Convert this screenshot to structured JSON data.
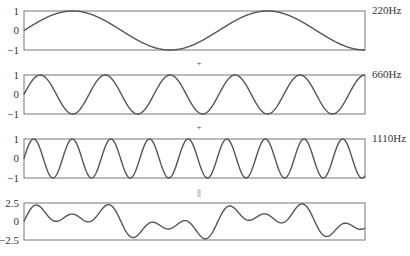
{
  "chart_data": {
    "type": "line",
    "xlabel": "",
    "ylabel": "",
    "grid": false,
    "duration_cycles_of_base": 1.75,
    "series": [
      {
        "name": "220Hz",
        "frequency": 220,
        "amplitude": 1,
        "ylim": [
          -1,
          1
        ],
        "yticks": [
          "1",
          "0",
          "−1"
        ]
      },
      {
        "name": "660Hz",
        "frequency": 660,
        "amplitude": 1,
        "ylim": [
          -1,
          1
        ],
        "yticks": [
          "1",
          "0",
          "−1"
        ]
      },
      {
        "name": "1110Hz",
        "frequency": 1110,
        "amplitude": 1,
        "ylim": [
          -1,
          1
        ],
        "yticks": [
          "1",
          "0",
          "−1"
        ]
      },
      {
        "name": "sum",
        "frequency": null,
        "amplitude": null,
        "ylim": [
          -2.5,
          2.5
        ],
        "yticks": [
          "2.5",
          "0",
          "−2.5"
        ]
      }
    ],
    "operators": [
      "+",
      "+",
      "="
    ]
  },
  "labels": {
    "panel1": "220Hz",
    "panel2": "660Hz",
    "panel3": "1110Hz"
  },
  "separators": {
    "plus1": "+",
    "plus2": "+",
    "equals": "||"
  },
  "ticks": {
    "p1": {
      "top": "1",
      "mid": "0",
      "bot": "−1"
    },
    "p2": {
      "top": "1",
      "mid": "0",
      "bot": "−1"
    },
    "p3": {
      "top": "1",
      "mid": "0",
      "bot": "−1"
    },
    "p4": {
      "top": "2.5",
      "mid": "0",
      "bot": "−2.5"
    }
  }
}
